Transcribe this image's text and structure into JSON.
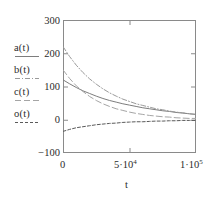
{
  "chart_data": {
    "type": "line",
    "title": "",
    "subtitle": "",
    "xlabel": "t",
    "ylabel": "",
    "xlim": [
      0,
      100000
    ],
    "ylim": [
      -100,
      300
    ],
    "grid": false,
    "legend_position": "left-outside",
    "xticks": [
      {
        "value": 0,
        "label": "0",
        "mantissa": "",
        "exponent": ""
      },
      {
        "value": 50000,
        "label": "5·10",
        "mantissa": "5·10",
        "exponent": "4"
      },
      {
        "value": 100000,
        "label": "1·10",
        "mantissa": "1·10",
        "exponent": "5"
      }
    ],
    "yticks": [
      {
        "value": 300,
        "label": "300"
      },
      {
        "value": 200,
        "label": "200"
      },
      {
        "value": 100,
        "label": "100"
      },
      {
        "value": 0,
        "label": "0"
      },
      {
        "value": -100,
        "label": "−100"
      }
    ],
    "x": [
      0,
      5000,
      10000,
      15000,
      20000,
      25000,
      30000,
      35000,
      40000,
      45000,
      50000,
      55000,
      60000,
      65000,
      70000,
      75000,
      80000,
      85000,
      90000,
      95000,
      100000
    ],
    "series": [
      {
        "name": "a(t)",
        "style": "solid",
        "color": "#7d7d7d",
        "values": [
          120,
          108,
          97,
          87,
          79,
          71,
          64,
          58,
          53,
          48,
          44,
          40,
          36,
          33,
          30,
          27,
          25,
          22,
          20,
          18,
          16
        ]
      },
      {
        "name": "b(t)",
        "style": "dash-dot",
        "color": "#9a9a9a",
        "values": [
          220,
          190,
          164,
          142,
          123,
          107,
          93,
          81,
          71,
          62,
          55,
          48,
          43,
          38,
          33,
          30,
          26,
          23,
          21,
          18,
          16
        ]
      },
      {
        "name": "c(t)",
        "style": "long-dash",
        "color": "#a5a5a5",
        "values": [
          150,
          124,
          102,
          85,
          70,
          58,
          48,
          40,
          33,
          28,
          23,
          19,
          16,
          13,
          11,
          9,
          8,
          6,
          5,
          4,
          4
        ]
      },
      {
        "name": "o(t)",
        "style": "short-dash",
        "color": "#5a5a5a",
        "values": [
          -35,
          -29,
          -24,
          -21,
          -18,
          -15,
          -13,
          -11,
          -10,
          -8,
          -7,
          -6,
          -6,
          -5,
          -4,
          -4,
          -3,
          -3,
          -2,
          -2,
          -2
        ]
      }
    ]
  },
  "legend": {
    "entries": [
      {
        "label": "a(t)",
        "style": "solid"
      },
      {
        "label": "b(t)",
        "style": "dash-dot"
      },
      {
        "label": "c(t)",
        "style": "long-dash"
      },
      {
        "label": "o(t)",
        "style": "short-dash"
      }
    ]
  },
  "axes": {
    "x_title": "t",
    "frame_color": "#8a8a8a"
  }
}
